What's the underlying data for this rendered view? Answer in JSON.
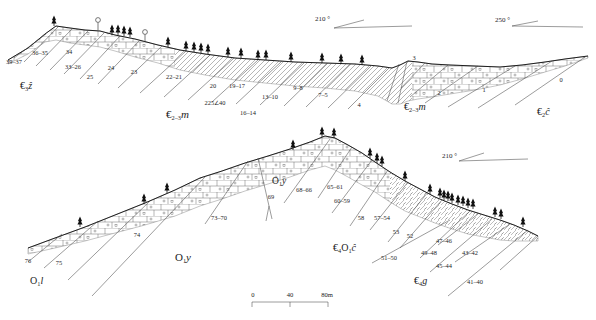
{
  "figure": {
    "type": "geological cross sections"
  },
  "icons": {
    "tree": "conifer-tree-icon",
    "surface_marker": "lollipop-marker-icon",
    "orientation": "dip-direction-angle-icon"
  },
  "orientation_marks": {
    "top_center": "210 °",
    "top_right": "250 °",
    "bottom_right": "210 °"
  },
  "scale_bar": {
    "tick_labels": [
      "0",
      "40",
      "80m"
    ]
  },
  "top_section": {
    "dip_measurement": "225∠40",
    "bed_numbers": [
      "39–37",
      "36–35",
      "34",
      "33–26",
      "25",
      "24",
      "23",
      "22–21",
      "20",
      "19–17",
      "16–14",
      "13–10",
      "9–8",
      "7–5",
      "4",
      "3",
      "2",
      "1",
      "0"
    ],
    "formations": {
      "left": [
        "€",
        "3",
        "ẑ"
      ],
      "center": [
        "€",
        "2–3",
        "m"
      ],
      "right": [
        "€",
        "2–3",
        "m"
      ],
      "far_right": [
        "€",
        "2",
        "ĉ"
      ]
    }
  },
  "bottom_section": {
    "bed_numbers": [
      "76",
      "75",
      "74",
      "73–70",
      "69",
      "68–66",
      "65–61",
      "60–59",
      "58",
      "57–54",
      "53",
      "52",
      "51–50",
      "49–48",
      "47–46",
      "45–44",
      "43–42",
      "41–40"
    ],
    "formations": {
      "left": [
        "O",
        "1",
        "l"
      ],
      "center": [
        "O",
        "1",
        "y"
      ],
      "summit": [
        "O",
        "1",
        "y"
      ],
      "right": [
        "€",
        "4",
        "O",
        "1",
        "ĉ"
      ],
      "far_right": [
        "€",
        "4",
        "g"
      ]
    }
  }
}
